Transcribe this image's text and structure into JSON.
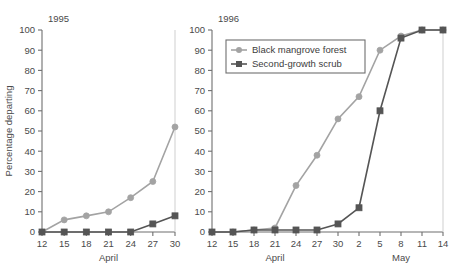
{
  "figure": {
    "ylabel": "Percentage departing",
    "y_ticks": [
      0,
      10,
      20,
      30,
      40,
      50,
      60,
      70,
      80,
      90,
      100
    ],
    "colors": {
      "black_mangrove_forest": "#a3a3a3",
      "second_growth_scrub": "#555555",
      "axis": "#6f6f6f",
      "text": "#4a4a4a",
      "background": "#ffffff"
    },
    "legend": {
      "position": "top-left-of-right-panel",
      "entries": [
        {
          "label": "Black mangrove forest",
          "marker": "circle",
          "color": "#a3a3a3"
        },
        {
          "label": "Second-growth scrub",
          "marker": "square",
          "color": "#555555"
        }
      ]
    }
  },
  "chart_data": [
    {
      "type": "line",
      "title": "1995",
      "panel": "left",
      "xlabel": "April",
      "ylabel": "Percentage departing",
      "ylim": [
        0,
        100
      ],
      "yticks": [
        0,
        10,
        20,
        30,
        40,
        50,
        60,
        70,
        80,
        90,
        100
      ],
      "grid": false,
      "x": [
        12,
        15,
        18,
        21,
        24,
        27,
        30
      ],
      "xticklabels": [
        "12",
        "15",
        "18",
        "21",
        "24",
        "27",
        "30"
      ],
      "xlim": [
        12,
        30
      ],
      "month_labels": [
        {
          "label": "April",
          "center_x": 21
        }
      ],
      "series": [
        {
          "name": "Black mangrove forest",
          "marker": "circle",
          "color": "#a3a3a3",
          "values": [
            0,
            6,
            8,
            10,
            17,
            25,
            52
          ]
        },
        {
          "name": "Second-growth scrub",
          "marker": "square",
          "color": "#555555",
          "values": [
            0,
            0,
            0,
            0,
            0,
            4,
            8
          ]
        }
      ]
    },
    {
      "type": "line",
      "title": "1996",
      "panel": "right",
      "xlabel": "April / May",
      "ylabel": "Percentage departing",
      "ylim": [
        0,
        100
      ],
      "yticks": [
        0,
        10,
        20,
        30,
        40,
        50,
        60,
        70,
        80,
        90,
        100
      ],
      "grid": false,
      "x": [
        12,
        15,
        18,
        21,
        24,
        27,
        30,
        33,
        36,
        39,
        42,
        45
      ],
      "xticklabels": [
        "12",
        "15",
        "18",
        "21",
        "24",
        "27",
        "30",
        "2",
        "5",
        "8",
        "11",
        "14"
      ],
      "xlim": [
        12,
        45
      ],
      "month_labels": [
        {
          "label": "April",
          "center_x": 21
        },
        {
          "label": "May",
          "center_x": 39
        }
      ],
      "series": [
        {
          "name": "Black mangrove forest",
          "marker": "circle",
          "color": "#a3a3a3",
          "values": [
            0,
            0,
            1,
            2,
            23,
            38,
            56,
            67,
            90,
            97,
            100,
            100
          ]
        },
        {
          "name": "Second-growth scrub",
          "marker": "square",
          "color": "#555555",
          "values": [
            0,
            0,
            1,
            1,
            1,
            1,
            4,
            12,
            60,
            96,
            100,
            100
          ]
        }
      ]
    }
  ]
}
